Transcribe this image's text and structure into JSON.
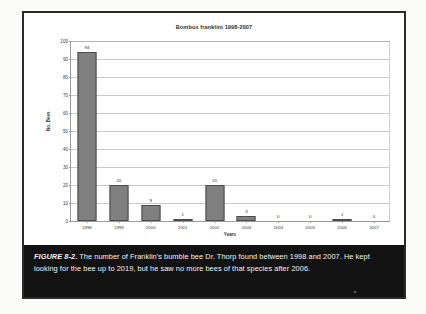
{
  "figure": {
    "caption_label": "FIGURE 8-2.",
    "caption_body": " The number of Franklin's bumble bee Dr. Thorp found between 1998 and 2007. He kept looking for the bee up to 2019, but he saw no more bees of that species after 2006.",
    "page_number": "o"
  },
  "chart_data": {
    "type": "bar",
    "title": "Bombus franklini 1998-2007",
    "xlabel": "Years",
    "ylabel": "No. Bees",
    "categories": [
      "1998",
      "1999",
      "2000",
      "2001",
      "2002",
      "2003",
      "2004",
      "2005",
      "2006",
      "2007"
    ],
    "values": [
      94,
      20,
      9,
      1,
      20,
      3,
      0,
      0,
      1,
      0
    ],
    "data_labels": [
      "94",
      "20",
      "9",
      "1",
      "20",
      "3",
      "0",
      "0",
      "1",
      "0"
    ],
    "ylim": [
      0,
      100
    ],
    "ytick_labels": [
      "0",
      "10",
      "20",
      "30",
      "40",
      "50",
      "60",
      "70",
      "80",
      "90",
      "100"
    ],
    "ytick_values": [
      0,
      10,
      20,
      30,
      40,
      50,
      60,
      70,
      80,
      90,
      100
    ],
    "grid": true,
    "legend": false,
    "colors": {
      "bar_fill": "#808080",
      "bar_border": "#4a4a4a",
      "gridline": "#c9c9c9",
      "axis": "#9a9a9a",
      "caption_band": "#121212",
      "caption_text": "#f2f2f2",
      "figure_border": "#2b2b2b"
    }
  }
}
